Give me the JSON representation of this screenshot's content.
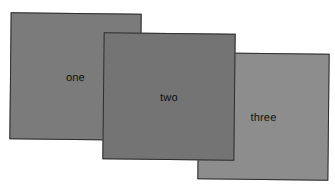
{
  "diagram": {
    "panels": [
      {
        "id": "one",
        "label": "one",
        "fill": "#7b7b7b",
        "border": "#2e2e2e"
      },
      {
        "id": "two",
        "label": "two",
        "fill": "#747474",
        "border": "#2e2e2e"
      },
      {
        "id": "three",
        "label": "three",
        "fill": "#8d8d8d",
        "border": "#2e2e2e"
      }
    ],
    "stacking_order_front_to_back": [
      "two",
      "three",
      "one"
    ]
  }
}
